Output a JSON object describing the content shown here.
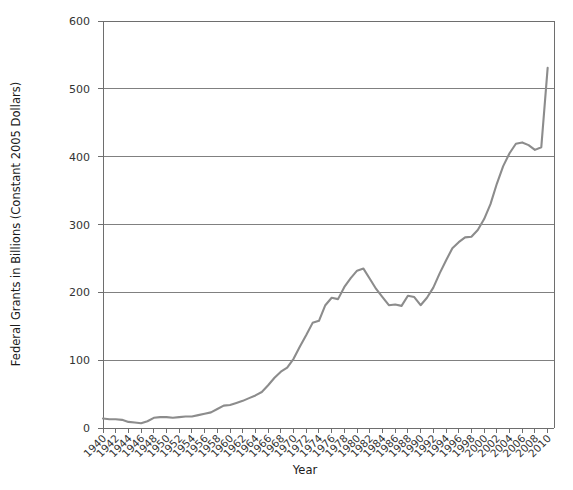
{
  "chart_data": {
    "type": "line",
    "title": "",
    "xlabel": "Year",
    "ylabel": "Federal Grants in Billions (Constant 2005 Dollars)",
    "xlim": [
      1940,
      2011
    ],
    "ylim": [
      0,
      600
    ],
    "ytick_values": [
      0,
      100,
      200,
      300,
      400,
      500,
      600
    ],
    "ytick_labels": [
      "0",
      "100",
      "200",
      "300",
      "400",
      "500",
      "600"
    ],
    "xtick_labels": [
      "1940",
      "1942",
      "1944",
      "1946",
      "1948",
      "1950",
      "1952",
      "1954",
      "1956",
      "1958",
      "1960",
      "1962",
      "1964",
      "1966",
      "1968",
      "1970",
      "1972",
      "1974",
      "1976",
      "1978",
      "1980",
      "1982",
      "1984",
      "1986",
      "1988",
      "1990",
      "1992",
      "1994",
      "1996",
      "1998",
      "2000",
      "2002",
      "2004",
      "2006",
      "2008",
      "2010"
    ],
    "xtick_values": [
      1940,
      1942,
      1944,
      1946,
      1948,
      1950,
      1952,
      1954,
      1956,
      1958,
      1960,
      1962,
      1964,
      1966,
      1968,
      1970,
      1972,
      1974,
      1976,
      1978,
      1980,
      1982,
      1984,
      1986,
      1988,
      1990,
      1992,
      1994,
      1996,
      1998,
      2000,
      2002,
      2004,
      2006,
      2008,
      2010
    ],
    "xtick_rotation_deg": 45,
    "grid": {
      "horizontal": true,
      "vertical": false
    },
    "legend": {
      "visible": false,
      "position": "none"
    },
    "line_color": "#8c8c8c",
    "grid_color": "#808080",
    "axis_color": "#6e6e6e",
    "series": [
      {
        "name": "Federal Grants",
        "x": [
          1940,
          1941,
          1942,
          1943,
          1944,
          1945,
          1946,
          1947,
          1948,
          1949,
          1950,
          1951,
          1952,
          1953,
          1954,
          1955,
          1956,
          1957,
          1958,
          1959,
          1960,
          1961,
          1962,
          1963,
          1964,
          1965,
          1966,
          1967,
          1968,
          1969,
          1970,
          1971,
          1972,
          1973,
          1974,
          1975,
          1976,
          1977,
          1978,
          1979,
          1980,
          1981,
          1982,
          1983,
          1984,
          1985,
          1986,
          1987,
          1988,
          1989,
          1990,
          1991,
          1992,
          1993,
          1994,
          1995,
          1996,
          1997,
          1998,
          1999,
          2000,
          2001,
          2002,
          2003,
          2004,
          2005,
          2006,
          2007,
          2008,
          2009,
          2010
        ],
        "y": [
          14,
          13,
          13,
          12,
          9,
          8,
          7,
          10,
          15,
          16,
          16,
          15,
          16,
          17,
          17,
          19,
          21,
          23,
          28,
          33,
          34,
          37,
          40,
          44,
          48,
          53,
          63,
          74,
          83,
          89,
          102,
          120,
          137,
          155,
          158,
          181,
          192,
          190,
          208,
          221,
          232,
          235,
          220,
          205,
          193,
          181,
          182,
          180,
          195,
          193,
          181,
          192,
          207,
          228,
          247,
          265,
          274,
          281,
          282,
          292,
          308,
          330,
          360,
          386,
          405,
          419,
          421,
          417,
          410,
          414,
          531
        ]
      }
    ]
  },
  "plot_geometry": {
    "left": 103,
    "right": 554,
    "top": 21,
    "bottom": 428
  },
  "icons": {
    "chart_type_icon": "line-chart-icon"
  }
}
